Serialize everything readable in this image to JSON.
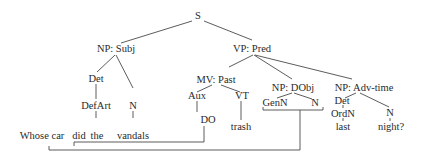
{
  "diagram": {
    "type": "syntax-tree",
    "nodes": {
      "s": "S",
      "np_subj": "NP: Subj",
      "vp_pred": "VP: Pred",
      "det_subj": "Det",
      "n_subj": "N",
      "defart": "DefArt",
      "mv_past": "MV: Past",
      "aux": "Aux",
      "vt": "VT",
      "do": "DO",
      "np_dobj": "NP: DObj",
      "genn": "GenN",
      "n_dobj": "N",
      "np_advtime": "NP: Adv-time",
      "det_adv": "Det",
      "ordn": "OrdN",
      "n_adv": "N"
    },
    "words": {
      "whose_car": "Whose car",
      "did": "did",
      "the": "the",
      "vandals": "vandals",
      "trash": "trash",
      "last": "last",
      "night": "night?"
    },
    "colors": {
      "text": "#2a2a2a",
      "lines": "#4a4a4a",
      "background": "#ffffff"
    }
  }
}
